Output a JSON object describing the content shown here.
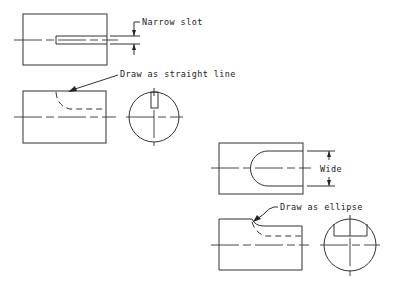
{
  "diagram": {
    "type": "engineering-drawing",
    "annotations": {
      "narrow_slot": "Narrow slot",
      "draw_straight": "Draw as straight line",
      "wide": "Wide",
      "draw_ellipse": "Draw as ellipse"
    },
    "views": [
      {
        "id": "narrow-slot-top-view",
        "label": "Narrow slot"
      },
      {
        "id": "narrow-slot-front-view",
        "label": "Draw as straight line"
      },
      {
        "id": "narrow-slot-end-view"
      },
      {
        "id": "wide-slot-top-view",
        "label": "Wide"
      },
      {
        "id": "wide-slot-front-view",
        "label": "Draw as ellipse"
      },
      {
        "id": "wide-slot-end-view"
      }
    ],
    "colors": {
      "line": "#333333",
      "background": "#ffffff"
    }
  }
}
